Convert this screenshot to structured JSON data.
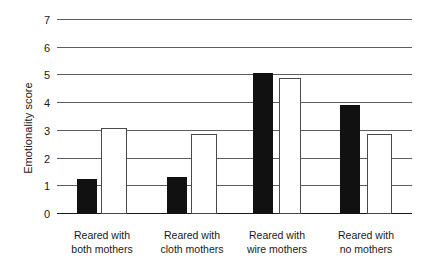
{
  "chart_data": {
    "type": "bar",
    "title": "",
    "xlabel": "",
    "ylabel": "Emotionality score",
    "ylim": [
      0,
      7
    ],
    "yticks": [
      0,
      1,
      2,
      3,
      4,
      5,
      6,
      7
    ],
    "ytick_labels": [
      "0",
      "1",
      "2",
      "3",
      "4",
      "5",
      "6",
      "7"
    ],
    "grid": true,
    "legend": "none",
    "categories": [
      "Reared with both mothers",
      "Reared with cloth mothers",
      "Reared with wire mothers",
      "Reared with no mothers"
    ],
    "category_lines": [
      [
        "Reared with",
        "both mothers"
      ],
      [
        "Reared with",
        "cloth mothers"
      ],
      [
        "Reared with",
        "wire mothers"
      ],
      [
        "Reared with",
        "no mothers"
      ]
    ],
    "series": [
      {
        "name": "filled",
        "style": "black-filled",
        "color": "#111111",
        "values": [
          1.25,
          1.35,
          5.1,
          3.95
        ]
      },
      {
        "name": "open",
        "style": "white-open",
        "color": "#ffffff",
        "values": [
          3.1,
          2.9,
          4.9,
          2.9
        ]
      }
    ]
  },
  "axis": {
    "ylabel": "Emotionality score"
  }
}
